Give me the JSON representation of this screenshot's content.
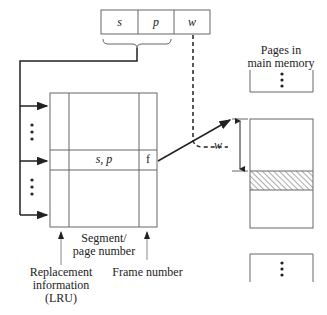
{
  "address": {
    "fields": [
      {
        "label": "s"
      },
      {
        "label": "p"
      },
      {
        "label": "w"
      }
    ]
  },
  "table": {
    "entry": {
      "key": "s, p",
      "frame": "f"
    }
  },
  "labels": {
    "segment_page_line1": "Segment/",
    "segment_page_line2": "page number",
    "replacement_line1": "Replacement",
    "replacement_line2": "information",
    "replacement_line3": "(LRU)",
    "frame_number": "Frame number",
    "pages_line1": "Pages in",
    "pages_line2": "main memory",
    "offset": "w"
  },
  "colors": {
    "line": "#222222",
    "box": "#666666",
    "hatch": "#555555"
  }
}
